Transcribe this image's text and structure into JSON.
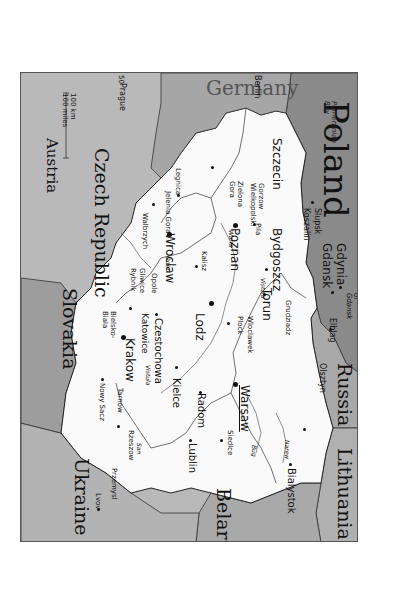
{
  "title": "Poland",
  "orientation": "rotated 90° clockwise (north to the right)",
  "colors": {
    "poland_fill": "#fafafa",
    "neighbor_fill": "#b9b9b9",
    "sea_fill": "#8a8a8a",
    "dark_neighbor_fill": "#9a9a9a",
    "border": "#333333",
    "page_bg": "#ffffff"
  },
  "countries": {
    "germany": "Germany",
    "czech": "Czech Republic",
    "austria": "Austria",
    "slovakia": "Slovakia",
    "ukraine": "Ukraine",
    "belarus": "Belarus",
    "lithuania": "Lithuania",
    "russia": "Russia"
  },
  "water": {
    "baltic": "Baltic Sea",
    "pomeranian": "Pomeranian Bay",
    "gdansk_gulf": "Gulf of Gdansk"
  },
  "rivers": {
    "oder": "Oder",
    "warta": "Warta",
    "vistula1": "Vistula",
    "vistula2": "Vistula",
    "bug": "Bug",
    "narew": "Narew",
    "san": "San"
  },
  "cities": {
    "warsaw": "Warsaw",
    "lodz": "Lodz",
    "krakow": "Krakow",
    "wroclaw": "Wroclaw",
    "poznan": "Poznan",
    "szczecin": "Szczecin",
    "bydgoszcz": "Bydgoszcz",
    "torun": "Torun",
    "gdansk": "Gdansk",
    "gdynia": "Gdynia",
    "lublin": "Lublin",
    "bialystok": "Bialystok",
    "radom": "Radom",
    "kielce": "Kielce",
    "czestochowa": "Czestochowa",
    "katowice": "Katowice",
    "olsztyn": "Olsztyn",
    "elblag": "Elblag",
    "slupsk": "Slupsk",
    "koszalin": "Koszalin",
    "gorzow": "Gorzow Wielkopolski",
    "pila": "Pila",
    "zielona_gora": "Zielona Gora",
    "jelenia_gora": "Jelenia Gora",
    "legnica": "Legnica",
    "walbrzych": "Walbrzych",
    "opole": "Opole",
    "gliwice": "Gliwice",
    "rybnik": "Rybnik",
    "bielsko": "Bielsko-Biala",
    "nowy_sacz": "Nowy Sacz",
    "tarnow": "Tarnow",
    "rzeszow": "Rzeszow",
    "przemysl": "Przemysl",
    "lvov": "Lvov",
    "kalisz": "Kalisz",
    "plock": "Plock",
    "wloclawek": "Wloclawek",
    "grudziadz": "Grudziadz",
    "siedlce": "Siedlce",
    "berlin": "Berlin",
    "prague": "Prague"
  },
  "scale": {
    "km": "100 km",
    "miles": "100 miles"
  },
  "graticule": {
    "lat50": "50",
    "lat55": "55",
    "lon20": "20",
    "lon25": "25"
  }
}
